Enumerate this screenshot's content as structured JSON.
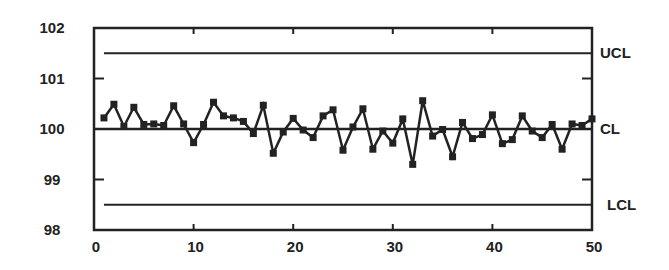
{
  "chart_data": {
    "type": "line",
    "title": "",
    "xlabel": "",
    "ylabel": "",
    "xlim": [
      0,
      50
    ],
    "ylim": [
      98,
      102
    ],
    "grid": false,
    "x_ticks": [
      0,
      10,
      20,
      30,
      40,
      50
    ],
    "y_ticks": [
      98,
      99,
      100,
      101,
      102
    ],
    "series": [
      {
        "name": "Measurements",
        "marker": "square",
        "x": [
          1,
          2,
          3,
          4,
          5,
          6,
          7,
          8,
          9,
          10,
          11,
          12,
          13,
          14,
          15,
          16,
          17,
          18,
          19,
          20,
          21,
          22,
          23,
          24,
          25,
          26,
          27,
          28,
          29,
          30,
          31,
          32,
          33,
          34,
          35,
          36,
          37,
          38,
          39,
          40,
          41,
          42,
          43,
          44,
          45,
          46,
          47,
          48,
          49,
          50
        ],
        "values": [
          100.22,
          100.49,
          100.05,
          100.43,
          100.09,
          100.1,
          100.07,
          100.46,
          100.1,
          99.73,
          100.09,
          100.53,
          100.26,
          100.22,
          100.15,
          99.91,
          100.47,
          99.52,
          99.94,
          100.21,
          99.98,
          99.83,
          100.26,
          100.38,
          99.58,
          100.04,
          100.4,
          99.6,
          99.96,
          99.72,
          100.2,
          99.3,
          100.56,
          99.86,
          99.99,
          99.45,
          100.13,
          99.81,
          99.89,
          100.28,
          99.71,
          99.79,
          100.26,
          99.96,
          99.83,
          100.09,
          99.6,
          100.1,
          100.07,
          100.2
        ]
      }
    ],
    "control_lines": [
      {
        "name": "UCL",
        "label": "UCL",
        "value": 101.5,
        "x_start": 1,
        "x_end": 50
      },
      {
        "name": "CL",
        "label": "CL",
        "value": 100,
        "x_start": 0,
        "x_end": 50
      },
      {
        "name": "LCL",
        "label": "LCL",
        "value": 98.5,
        "x_start": 1,
        "x_end": 50
      }
    ],
    "legend": "none"
  },
  "colors": {
    "line": "#222222",
    "axis": "#222222",
    "background": "#ffffff"
  }
}
